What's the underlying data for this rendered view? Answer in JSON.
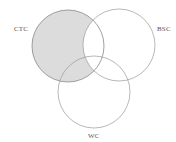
{
  "diagram": {
    "type": "venn",
    "sets": [
      {
        "id": "CTC",
        "label": "CTC",
        "cx": 68,
        "cy": 46,
        "r": 36,
        "label_x": 14,
        "label_y": 31
      },
      {
        "id": "BSC",
        "label": "BSC",
        "cx": 119,
        "cy": 45,
        "r": 36,
        "label_x": 157,
        "label_y": 31
      },
      {
        "id": "WC",
        "label": "WC",
        "cx": 94,
        "cy": 92,
        "r": 36,
        "label_x": 88,
        "label_y": 138
      }
    ],
    "shaded_region": "CTC minus BSC",
    "colors": {
      "shade_fill": "#dcdcdc",
      "outline": "#9a9a9a",
      "shaded_outline": "#888888",
      "background": "#ffffff"
    }
  }
}
